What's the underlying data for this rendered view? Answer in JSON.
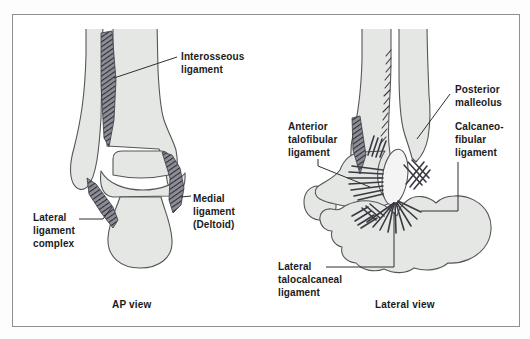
{
  "ap_view": {
    "caption": "AP view",
    "labels": {
      "interosseous": "Interosseous\nligament",
      "medial": "Medial\nligament\n(Deltoid)",
      "lateral_complex": "Lateral\nligament\ncomplex"
    }
  },
  "lateral_view": {
    "caption": "Lateral view",
    "labels": {
      "anterior_talofibular": "Anterior\ntalofibular\nligament",
      "posterior_malleolus": "Posterior\nmalleolus",
      "calcaneofibular": "Calcaneo-\nfibular\nligament",
      "lateral_talocalcaneal": "Lateral\ntalocalcaneal\nligament"
    }
  },
  "colors": {
    "bone_fill": "#e5e7e5",
    "outline": "#565656",
    "ligament_dark": "#3a3a42",
    "text": "#1b1b1b",
    "frame_border": "#8f8f8f",
    "background": "#ffffff"
  }
}
